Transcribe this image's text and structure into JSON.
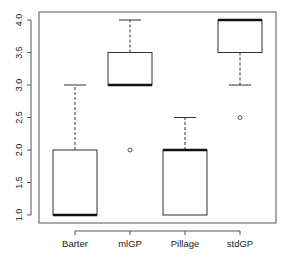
{
  "chart_data": {
    "type": "boxplot",
    "title": "",
    "xlabel": "",
    "ylabel": "",
    "ylim": [
      0.9,
      4.1
    ],
    "yticks": [
      "1.0",
      "1.5",
      "2.0",
      "2.5",
      "3.0",
      "3.5",
      "4.0"
    ],
    "categories": [
      "Barter",
      "mlGP",
      "Pillage",
      "stdGP"
    ],
    "boxes": [
      {
        "name": "Barter",
        "whisker_low": 1.0,
        "q1": 1.0,
        "median": 1.0,
        "q3": 2.0,
        "whisker_high": 3.0,
        "outliers": []
      },
      {
        "name": "mlGP",
        "whisker_low": 3.0,
        "q1": 3.0,
        "median": 3.0,
        "q3": 3.5,
        "whisker_high": 4.0,
        "outliers": [
          2.0
        ]
      },
      {
        "name": "Pillage",
        "whisker_low": 1.0,
        "q1": 1.0,
        "median": 2.0,
        "q3": 2.0,
        "whisker_high": 2.5,
        "outliers": []
      },
      {
        "name": "stdGP",
        "whisker_low": 3.0,
        "q1": 3.5,
        "median": 4.0,
        "q3": 4.0,
        "whisker_high": 4.0,
        "outliers": [
          2.5
        ]
      }
    ],
    "grid": false,
    "legend": null
  }
}
